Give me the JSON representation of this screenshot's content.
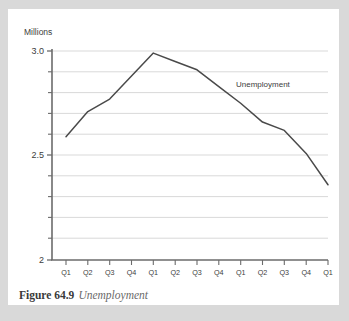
{
  "figure": {
    "caption_number": "Figure 64.9",
    "caption_title": "Unemployment"
  },
  "colors": {
    "page_background": "#d9d9d9",
    "card_background": "#ffffff",
    "series_line": "#4a4a4a",
    "gridline": "#c8c8c8",
    "axis": "#6b6b6b",
    "text": "#3d3d3d"
  },
  "chart_data": {
    "type": "line",
    "title": "",
    "subtitle": "",
    "xlabel": "",
    "ylabel": "Millions",
    "ylim": [
      2,
      3.0
    ],
    "ytick_labels": [
      "3.0",
      "2.5",
      "2"
    ],
    "ytick_values": [
      3.0,
      2.5,
      2.0
    ],
    "yminor_step": 0.1,
    "grid": true,
    "legend_position": "inline-annotation",
    "annotations": [
      {
        "text": "Unemployment",
        "x_category": "1993 Q4",
        "y_value": 2.83
      }
    ],
    "categories": [
      "Q1",
      "Q2",
      "Q3",
      "Q4",
      "Q1",
      "Q2",
      "Q3",
      "Q4",
      "Q1",
      "Q2",
      "Q3",
      "Q4",
      "Q1"
    ],
    "year_groups": [
      {
        "label": "1992",
        "quarters": [
          "Q1",
          "Q2",
          "Q3",
          "Q4"
        ]
      },
      {
        "label": "1993",
        "quarters": [
          "Q1",
          "Q2",
          "Q3",
          "Q4"
        ]
      },
      {
        "label": "1994",
        "quarters": [
          "Q1",
          "Q2",
          "Q3",
          "Q4"
        ]
      },
      {
        "label": "1995",
        "quarters": [
          "Q1"
        ]
      }
    ],
    "series": [
      {
        "name": "Unemployment",
        "values": [
          2.59,
          2.71,
          2.77,
          2.88,
          2.99,
          2.95,
          2.91,
          2.83,
          2.75,
          2.66,
          2.62,
          2.51,
          2.36
        ]
      }
    ]
  }
}
